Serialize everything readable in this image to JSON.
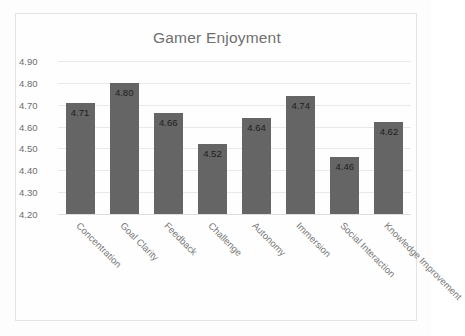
{
  "chart_data": {
    "type": "bar",
    "title": "Gamer Enjoyment",
    "xlabel": "",
    "ylabel": "",
    "ylim": [
      4.2,
      4.9
    ],
    "ytick_step": 0.1,
    "grid": true,
    "legend": "none",
    "label_rotation_deg": 45,
    "bar_color": "#656565",
    "categories": [
      "Concentration",
      "Goal Clarity",
      "Feedback",
      "Challenge",
      "Autonomy",
      "Immersion",
      "Social Interaction",
      "Knowledge Improvement"
    ],
    "values": [
      4.71,
      4.8,
      4.66,
      4.52,
      4.64,
      4.74,
      4.46,
      4.62
    ],
    "value_labels": [
      "4.71",
      "4.80",
      "4.66",
      "4.52",
      "4.64",
      "4.74",
      "4.46",
      "4.62"
    ],
    "ytick_labels": [
      "4.90",
      "4.80",
      "4.70",
      "4.60",
      "4.50",
      "4.40",
      "4.30",
      "4.20"
    ],
    "yticks": [
      4.9,
      4.8,
      4.7,
      4.6,
      4.5,
      4.4,
      4.3,
      4.2
    ]
  },
  "colors": {
    "bar": "#656565",
    "title_text": "#6f6f6f",
    "tick_text": "#6d6d6d",
    "category_text": "#787878",
    "value_text": "#1d1d1d",
    "gridline": "#e9e9e9",
    "frame_border": "#e3e3e3",
    "background": "#fdfdfd"
  }
}
